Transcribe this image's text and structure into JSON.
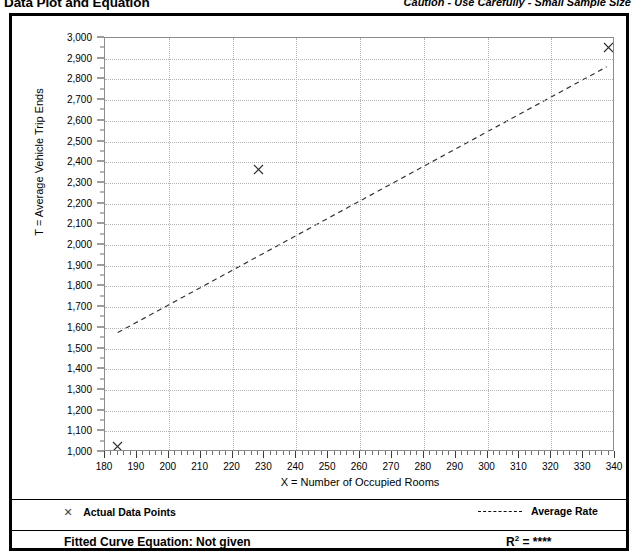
{
  "header": {
    "title": "Data Plot and Equation",
    "caution": "Caution - Use Carefully - Small Sample Size"
  },
  "legend": {
    "data_points_label": "Actual Data Points",
    "average_rate_label": "Average Rate",
    "x_marker": "×"
  },
  "footer": {
    "equation_label": "Fitted Curve Equation:  Not given",
    "r2_prefix": "R",
    "r2_sup": "2",
    "r2_value": "= ****"
  },
  "chart_data": {
    "type": "scatter",
    "title": "Data Plot and Equation",
    "subtitle": "Caution - Use Carefully - Small Sample Size",
    "xlabel": "X = Number of Occupied Rooms",
    "ylabel": "T = Average Vehicle Trip Ends",
    "xlim": [
      180,
      340
    ],
    "ylim": [
      1000,
      3000
    ],
    "grid": true,
    "legend_position": "below-plot",
    "x_ticks": [
      180,
      190,
      200,
      210,
      220,
      230,
      240,
      250,
      260,
      270,
      280,
      290,
      300,
      310,
      320,
      330,
      340
    ],
    "x_tick_labels": [
      "180",
      "190",
      "200",
      "210",
      "220",
      "230",
      "240",
      "250",
      "260",
      "270",
      "280",
      "290",
      "300",
      "310",
      "320",
      "330",
      "340"
    ],
    "x_minor_tick_step": 2,
    "x_gridline_step": 20,
    "y_ticks": [
      1000,
      1100,
      1200,
      1300,
      1400,
      1500,
      1600,
      1700,
      1800,
      1900,
      2000,
      2100,
      2200,
      2300,
      2400,
      2500,
      2600,
      2700,
      2800,
      2900,
      3000
    ],
    "y_tick_labels": [
      "1,000",
      "1,100",
      "1,200",
      "1,300",
      "1,400",
      "1,500",
      "1,600",
      "1,700",
      "1,800",
      "1,900",
      "2,000",
      "2,100",
      "2,200",
      "2,300",
      "2,400",
      "2,500",
      "2,600",
      "2,700",
      "2,800",
      "2,900",
      "3,000"
    ],
    "y_minor_tick_step": 50,
    "y_gridline_step": 100,
    "series": [
      {
        "name": "Actual Data Points",
        "type": "scatter",
        "marker": "x",
        "points": [
          {
            "x": 184,
            "y": 1040
          },
          {
            "x": 228,
            "y": 2380
          },
          {
            "x": 338,
            "y": 2970
          }
        ]
      },
      {
        "name": "Average Rate",
        "type": "line",
        "style": "dashed",
        "points": [
          {
            "x": 184,
            "y": 1570
          },
          {
            "x": 338,
            "y": 2860
          }
        ]
      }
    ]
  }
}
